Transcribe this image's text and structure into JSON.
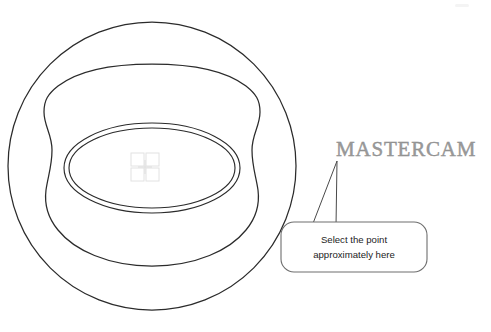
{
  "image": {
    "width": 491,
    "height": 332,
    "background_color": "#ffffff",
    "kind": "technical-line-drawing-with-callout"
  },
  "drawing": {
    "title": "Mastercam part outline with point-selection callout",
    "line_color": "#2b2b2b",
    "shapes": [
      {
        "name": "outer-circle",
        "type": "circle",
        "cx": 152,
        "cy": 166,
        "r": 144
      },
      {
        "name": "inner-squircle",
        "type": "rounded-square-concave",
        "left": 44,
        "top": 64,
        "right": 262,
        "bottom": 266
      },
      {
        "name": "outer-ellipse",
        "type": "ellipse",
        "cx": 152,
        "cy": 168,
        "rx": 88,
        "ry": 45
      },
      {
        "name": "inner-ellipse",
        "type": "ellipse",
        "cx": 152,
        "cy": 168,
        "rx": 83,
        "ry": 40
      }
    ]
  },
  "point_marker": {
    "name": "selection-point-marker",
    "cx": 145,
    "cy": 167,
    "size": 28,
    "color": "#e0e0e0"
  },
  "callout": {
    "line_1": "Select the point",
    "line_2": "approximately here",
    "box": {
      "x": 281,
      "y": 222,
      "width": 146,
      "height": 50,
      "corner_radius": 13,
      "fill": "#ffffff",
      "stroke": "#6e6e6e"
    },
    "tail": {
      "tip_x": 337,
      "tip_y": 161,
      "base_left_x": 312,
      "base_right_x": 336
    }
  },
  "brand": {
    "label": "MASTERCAM",
    "color": "#9a9a9a",
    "x": 336,
    "y": 139
  }
}
